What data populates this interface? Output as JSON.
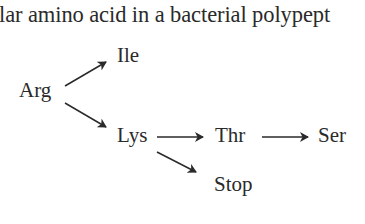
{
  "text": {
    "top_line": "lar amino acid in a bacterial polypept",
    "bottom_line_partial": "ed"
  },
  "diagram": {
    "nodes": {
      "arg": "Arg",
      "ile": "Ile",
      "lys": "Lys",
      "thr": "Thr",
      "ser": "Ser",
      "stop": "Stop"
    },
    "edges": [
      {
        "from": "Arg",
        "to": "Ile"
      },
      {
        "from": "Arg",
        "to": "Lys"
      },
      {
        "from": "Lys",
        "to": "Thr"
      },
      {
        "from": "Thr",
        "to": "Ser"
      },
      {
        "from": "Lys",
        "to": "Stop"
      }
    ],
    "colors": {
      "ink": "#2a2a2a",
      "background": "#ffffff"
    }
  }
}
